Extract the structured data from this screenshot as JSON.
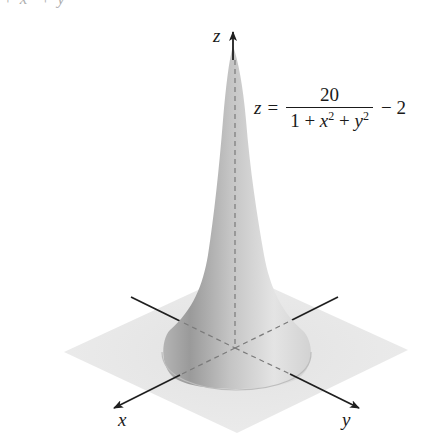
{
  "figure": {
    "clipped_top_text": "+ x² + y",
    "axes": {
      "x_label": "x",
      "y_label": "y",
      "z_label": "z"
    },
    "equation": {
      "lhs": "z",
      "equals": "=",
      "numerator": "20",
      "denominator_parts": [
        "1 + ",
        "x",
        "2",
        " + ",
        "y",
        "2"
      ],
      "rhs": "− 2"
    },
    "colors": {
      "plane": "#e6e6e6",
      "surface_light": "#efefef",
      "surface_dark": "#9a9a9a",
      "axis": "#1f1f1f",
      "dashed_axis": "#7a7a7a"
    }
  }
}
